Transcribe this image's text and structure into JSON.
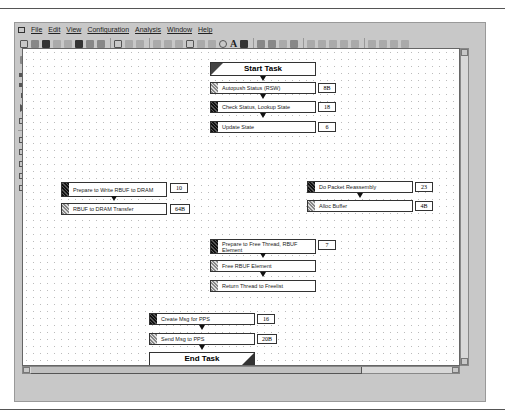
{
  "menu": {
    "items": [
      "File",
      "Edit",
      "View",
      "Configuration",
      "Analysis",
      "Window",
      "Help"
    ]
  },
  "toolbar": {
    "text_tool_label": "A"
  },
  "flow": {
    "start": {
      "label": "Start Task"
    },
    "end": {
      "label": "End Task"
    },
    "nodes": [
      {
        "id": "autopush",
        "label": "Autopush Status (RSW)",
        "value": "8B",
        "marker": "light"
      },
      {
        "id": "check_status",
        "label": "Check Status, Lookup State",
        "value": "18",
        "marker": "dark"
      },
      {
        "id": "update_state",
        "label": "Update State",
        "value": "6",
        "marker": "dark"
      },
      {
        "id": "prepare_write",
        "label": "Prepare to Write RBUF to DRAM",
        "value": "10",
        "marker": "dark"
      },
      {
        "id": "rbuf_transfer",
        "label": "RBUF to DRAM Transfer",
        "value": "64B",
        "marker": "light"
      },
      {
        "id": "reassembly",
        "label": "Do Packet Reassembly",
        "value": "23",
        "marker": "dark"
      },
      {
        "id": "alloc_buffer",
        "label": "Alloc Buffer",
        "value": "4B",
        "marker": "light"
      },
      {
        "id": "prepare_free",
        "label": "Prepare to Free Thread, RBUF Element",
        "value": "7",
        "marker": "dark"
      },
      {
        "id": "free_rbuf",
        "label": "Free RBUF Element",
        "value": "",
        "marker": "light"
      },
      {
        "id": "return_thread",
        "label": "Return Thread to Freelist",
        "value": "",
        "marker": "light"
      },
      {
        "id": "create_msg",
        "label": "Create Msg for PPS",
        "value": "16",
        "marker": "dark"
      },
      {
        "id": "send_msg",
        "label": "Send Msg to PPS",
        "value": "20B",
        "marker": "light"
      }
    ]
  }
}
